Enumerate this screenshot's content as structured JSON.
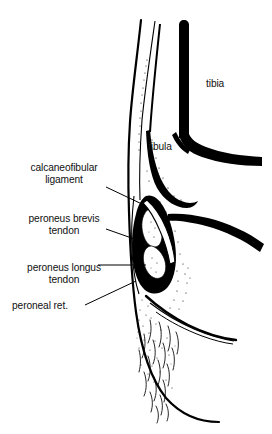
{
  "figure": {
    "ink_color": "#000000",
    "background_color": "#ffffff",
    "width": 272,
    "height": 434
  },
  "labels": {
    "calcaneofibular_ligament": "calcaneofibular\nligament",
    "peroneus_brevis_tendon": "peroneus brevis\ntendon",
    "peroneus_longus_tendon": "peroneus longus\ntendon",
    "peroneal_retinaculum": "peroneal ret.",
    "tibia": "tibia",
    "fibula": "fibula"
  },
  "structures": [
    {
      "name": "tibia",
      "kind": "bone",
      "label": "tibia"
    },
    {
      "name": "fibula",
      "kind": "bone",
      "label": "fibula"
    },
    {
      "name": "calcaneofibular-ligament",
      "kind": "ligament",
      "label": "calcaneofibular ligament"
    },
    {
      "name": "peroneus-brevis-tendon",
      "kind": "tendon",
      "label": "peroneus brevis tendon"
    },
    {
      "name": "peroneus-longus-tendon",
      "kind": "tendon",
      "label": "peroneus longus tendon"
    },
    {
      "name": "peroneal-retinaculum",
      "kind": "retinaculum",
      "label": "peroneal ret."
    },
    {
      "name": "skin-outline",
      "kind": "soft-tissue",
      "label": ""
    },
    {
      "name": "subcutaneous-fat-hatching",
      "kind": "soft-tissue",
      "label": ""
    }
  ]
}
